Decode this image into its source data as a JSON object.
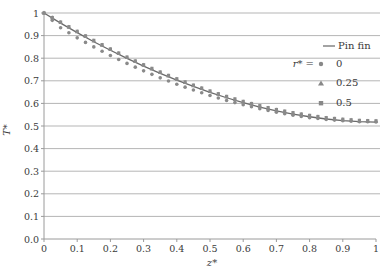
{
  "chart_data": {
    "type": "line",
    "title": "",
    "xlabel": "z*",
    "ylabel": "T*",
    "xlim": [
      0,
      1
    ],
    "ylim": [
      0,
      1
    ],
    "grid": {
      "horizontal": true,
      "vertical": false
    },
    "legend_position": "right-top inside",
    "x_ticks": [
      "0",
      "0.1",
      "0.2",
      "0.3",
      "0.4",
      "0.5",
      "0.6",
      "0.7",
      "0.8",
      "0.9",
      "1"
    ],
    "y_ticks": [
      "0.0",
      "0.1",
      "0.2",
      "0.3",
      "0.4",
      "0.5",
      "0.6",
      "0.7",
      "0.8",
      "0.9",
      "1"
    ],
    "legend": {
      "line_label": "Pin fin",
      "marker_prefix": "r* =",
      "entries": [
        {
          "label": "0",
          "marker": "circle"
        },
        {
          "label": "0.25",
          "marker": "triangle"
        },
        {
          "label": "0.5",
          "marker": "square"
        }
      ]
    },
    "x": [
      0,
      0.05,
      0.1,
      0.15,
      0.2,
      0.25,
      0.3,
      0.35,
      0.4,
      0.45,
      0.5,
      0.55,
      0.6,
      0.65,
      0.7,
      0.75,
      0.8,
      0.85,
      0.9,
      0.95,
      1
    ],
    "series": [
      {
        "name": "Pin fin",
        "style": "line",
        "values": [
          1.0,
          0.955,
          0.913,
          0.873,
          0.835,
          0.799,
          0.765,
          0.733,
          0.703,
          0.675,
          0.649,
          0.625,
          0.603,
          0.584,
          0.567,
          0.553,
          0.541,
          0.531,
          0.524,
          0.519,
          0.517
        ]
      },
      {
        "name": "r* = 0",
        "style": "circle",
        "values": [
          1.0,
          0.935,
          0.89,
          0.85,
          0.812,
          0.777,
          0.744,
          0.713,
          0.685,
          0.659,
          0.635,
          0.613,
          0.594,
          0.576,
          0.561,
          0.548,
          0.537,
          0.529,
          0.523,
          0.519,
          0.518
        ]
      },
      {
        "name": "r* = 0.25",
        "style": "triangle",
        "values": [
          1.0,
          0.958,
          0.917,
          0.877,
          0.839,
          0.803,
          0.769,
          0.737,
          0.707,
          0.679,
          0.653,
          0.629,
          0.607,
          0.588,
          0.571,
          0.557,
          0.545,
          0.535,
          0.528,
          0.523,
          0.521
        ]
      },
      {
        "name": "r* = 0.5",
        "style": "square",
        "values": [
          1.0,
          0.96,
          0.919,
          0.879,
          0.841,
          0.805,
          0.771,
          0.739,
          0.709,
          0.681,
          0.655,
          0.631,
          0.609,
          0.59,
          0.573,
          0.559,
          0.547,
          0.537,
          0.53,
          0.525,
          0.523
        ]
      }
    ]
  }
}
